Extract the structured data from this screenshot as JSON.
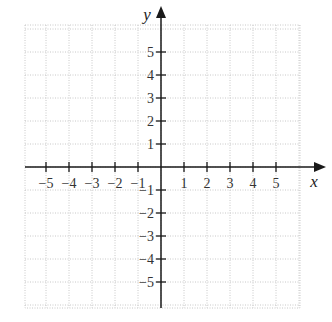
{
  "chart_data": {
    "type": "scatter",
    "title": "",
    "xlabel": "x",
    "ylabel": "y",
    "xlim": [
      -5.9,
      5.9
    ],
    "ylim": [
      -6,
      6
    ],
    "x_ticks": [
      -5,
      -4,
      -3,
      -2,
      -1,
      1,
      2,
      3,
      4,
      5
    ],
    "y_ticks": [
      -5,
      -4,
      -3,
      -2,
      -1,
      1,
      2,
      3,
      4,
      5
    ],
    "x_tick_labels": [
      "−5",
      "−4",
      "−3",
      "−2",
      "−1",
      "1",
      "2",
      "3",
      "4",
      "5"
    ],
    "y_tick_labels": [
      "−5",
      "−4",
      "−3",
      "−2",
      "−1",
      "1",
      "2",
      "3",
      "4",
      "5"
    ],
    "grid": true,
    "grid_style": "dotted",
    "series": [],
    "legend": null
  },
  "colors": {
    "axis": "#1a1a1a",
    "grid": "#c8c8c8",
    "text": "#333333"
  }
}
